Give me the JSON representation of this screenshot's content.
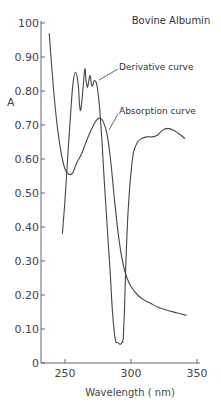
{
  "chart_data": {
    "type": "line",
    "title": "Bovine Albumin",
    "xlabel": "Wavelength ( nm)",
    "ylabel": "A",
    "xlim": [
      235,
      352
    ],
    "ylim": [
      0,
      1.0
    ],
    "x_ticks": [
      250,
      300,
      350
    ],
    "x_tick_labels": [
      "250",
      "300",
      "350"
    ],
    "y_ticks": [
      0,
      0.1,
      0.2,
      0.3,
      0.4,
      0.5,
      0.6,
      0.7,
      0.8,
      0.9,
      1.0
    ],
    "y_tick_labels": [
      "0",
      "0.10",
      "0.20",
      "0.30",
      "0.40",
      "0.50",
      "0.60",
      "0.70",
      "0.80",
      "0.90",
      "100"
    ],
    "grid": false,
    "legend": "none (curves labeled by annotation)",
    "series": [
      {
        "name": "Absorption curve",
        "x": [
          238,
          241,
          244,
          247,
          250,
          253,
          256,
          259,
          262,
          265,
          268,
          271,
          274,
          276.5,
          279,
          282,
          285,
          288,
          291,
          294,
          297,
          300,
          305,
          310,
          315,
          320,
          325,
          330,
          335,
          342
        ],
        "y": [
          0.97,
          0.82,
          0.7,
          0.62,
          0.57,
          0.555,
          0.56,
          0.59,
          0.61,
          0.64,
          0.67,
          0.695,
          0.715,
          0.72,
          0.71,
          0.67,
          0.58,
          0.46,
          0.36,
          0.29,
          0.25,
          0.225,
          0.2,
          0.185,
          0.175,
          0.165,
          0.158,
          0.152,
          0.147,
          0.14
        ]
      },
      {
        "name": "Derivative curve",
        "x": [
          248,
          250,
          252,
          254,
          256,
          258,
          260,
          261,
          262,
          263.5,
          265,
          266,
          267,
          268,
          269,
          270,
          271,
          272,
          274,
          276,
          278,
          280,
          282,
          284,
          286,
          288,
          290,
          292,
          293,
          294,
          295,
          296,
          297,
          298,
          300,
          302,
          305,
          308,
          312,
          316,
          320,
          324,
          328,
          332,
          336,
          341
        ],
        "y": [
          0.38,
          0.48,
          0.6,
          0.72,
          0.82,
          0.855,
          0.82,
          0.76,
          0.745,
          0.8,
          0.865,
          0.83,
          0.81,
          0.83,
          0.845,
          0.82,
          0.815,
          0.83,
          0.82,
          0.76,
          0.65,
          0.52,
          0.4,
          0.28,
          0.15,
          0.07,
          0.06,
          0.055,
          0.06,
          0.07,
          0.15,
          0.28,
          0.38,
          0.46,
          0.56,
          0.62,
          0.65,
          0.66,
          0.665,
          0.665,
          0.67,
          0.685,
          0.69,
          0.685,
          0.675,
          0.66
        ]
      }
    ],
    "annotations": [
      {
        "text": "Bovine Albumin",
        "type": "title"
      },
      {
        "text": "Derivative curve",
        "points_to": "Derivative curve near 271 nm, 0.83"
      },
      {
        "text": "Absorption curve",
        "points_to": "Absorption curve near 279 nm, 0.69"
      }
    ]
  }
}
